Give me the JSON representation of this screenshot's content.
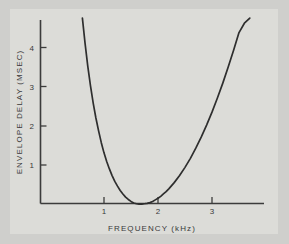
{
  "figure": {
    "background_color": "#cfcfcc",
    "plot_background_color": "#dcdcd8",
    "line_color": "#2e2e2e",
    "axis_color": "#3b3b3b"
  },
  "chart_data": {
    "type": "line",
    "title": "",
    "xlabel": "FREQUENCY  (kHz)",
    "ylabel": "ENVELOPE DELAY (MSEC)",
    "xlim": [
      0.12,
      3.85
    ],
    "ylim": [
      0,
      4.75
    ],
    "xticks": [
      1,
      2,
      3
    ],
    "xtick_labels": [
      "1",
      "2",
      "3"
    ],
    "yticks": [
      1,
      2,
      3,
      4
    ],
    "ytick_labels": [
      "1",
      "2",
      "3",
      "4"
    ],
    "grid": false,
    "legend": null,
    "annotations": [],
    "series": [
      {
        "name": "envelope delay",
        "x": [
          0.6,
          0.65,
          0.7,
          0.75,
          0.8,
          0.85,
          0.9,
          0.95,
          1.0,
          1.05,
          1.1,
          1.15,
          1.2,
          1.25,
          1.3,
          1.35,
          1.4,
          1.45,
          1.5,
          1.55,
          1.6,
          1.65,
          1.7,
          1.75,
          1.8,
          1.85,
          1.9,
          1.95,
          2.0,
          2.05,
          2.1,
          2.15,
          2.2,
          2.3,
          2.4,
          2.5,
          2.6,
          2.7,
          2.8,
          2.9,
          3.0,
          3.1,
          3.2,
          3.3,
          3.4,
          3.5,
          3.6,
          3.7
        ],
        "y": [
          4.75,
          4.1,
          3.52,
          3.02,
          2.58,
          2.2,
          1.87,
          1.57,
          1.31,
          1.09,
          0.9,
          0.73,
          0.58,
          0.46,
          0.35,
          0.26,
          0.18,
          0.12,
          0.07,
          0.03,
          0.01,
          0.0,
          0.0,
          0.01,
          0.02,
          0.04,
          0.07,
          0.11,
          0.15,
          0.2,
          0.26,
          0.32,
          0.39,
          0.55,
          0.73,
          0.94,
          1.17,
          1.43,
          1.71,
          2.02,
          2.35,
          2.71,
          3.09,
          3.5,
          3.93,
          4.38,
          4.62,
          4.75
        ]
      }
    ],
    "curve_minimum": {
      "x": 1.72,
      "y": 0.0
    }
  }
}
